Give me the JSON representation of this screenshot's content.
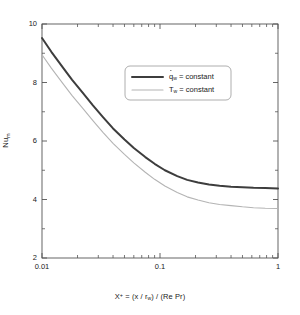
{
  "chart_data": {
    "type": "line",
    "title": "",
    "subtitle": "",
    "xlabel": "X⁺ = (x / r_w) / (Re Pr)",
    "ylabel": "Nu_m",
    "xscale": "log",
    "yscale": "linear",
    "xlim": [
      0.01,
      1
    ],
    "ylim": [
      2,
      10
    ],
    "grid": false,
    "legend_position": "upper-center-right",
    "xticks": [
      0.01,
      0.1,
      1
    ],
    "xtick_labels": [
      "0.01",
      "0.1",
      "1"
    ],
    "yticks": [
      2,
      4,
      6,
      8,
      10
    ],
    "ytick_labels": [
      "2",
      "4",
      "6",
      "8",
      "10"
    ],
    "x": [
      0.01,
      0.012,
      0.015,
      0.018,
      0.022,
      0.027,
      0.033,
      0.04,
      0.05,
      0.06,
      0.075,
      0.09,
      0.11,
      0.14,
      0.17,
      0.21,
      0.26,
      0.32,
      0.4,
      0.5,
      0.62,
      0.78,
      1.0
    ],
    "series": [
      {
        "name": "q_w = constant",
        "color": "#3d3d3d",
        "width": 2.0,
        "values": [
          9.52,
          9.05,
          8.52,
          8.09,
          7.66,
          7.22,
          6.81,
          6.43,
          6.05,
          5.76,
          5.45,
          5.22,
          5.0,
          4.8,
          4.67,
          4.58,
          4.51,
          4.47,
          4.44,
          4.42,
          4.4,
          4.39,
          4.38
        ]
      },
      {
        "name": "T_w = constant",
        "color": "#b4b4b4",
        "width": 1.1,
        "values": [
          8.95,
          8.49,
          7.97,
          7.55,
          7.13,
          6.7,
          6.29,
          5.92,
          5.54,
          5.25,
          4.93,
          4.69,
          4.46,
          4.24,
          4.09,
          3.98,
          3.89,
          3.83,
          3.79,
          3.75,
          3.72,
          3.7,
          3.69
        ]
      }
    ],
    "annotations": []
  },
  "axes": {
    "x_title_prefix": "X",
    "x_title_sup": "+",
    "x_title_rest": " = (x / r",
    "x_title_sub": "w",
    "x_title_tail": ") / (Re Pr)",
    "y_title_main": "Nu",
    "y_title_sub": "m"
  },
  "legend": {
    "entries": [
      {
        "symbol": "q",
        "dot": true,
        "sub": "w",
        "text": " = constant",
        "color": "#3d3d3d",
        "width": "2.0"
      },
      {
        "symbol": "T",
        "dot": false,
        "sub": "w",
        "text": " = constant",
        "color": "#b4b4b4",
        "width": "1.1"
      }
    ]
  },
  "style": {
    "background": "#ffffff",
    "axis_color": "#555555",
    "text_color": "#1a1a1a",
    "legend_border": "#999999"
  }
}
